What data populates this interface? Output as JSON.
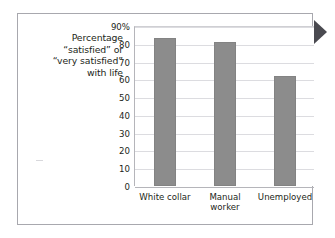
{
  "figure": {
    "axis_title_lines": [
      "Percentage",
      "“satisfied” or",
      "“very satisfied”",
      "with life"
    ],
    "pointer_icon": "right-triangle-pointer-icon",
    "frame_color": "#a8a8ae",
    "bar_color": "#8c8c8c",
    "grid_color": "#dcdce0",
    "text_color": "#231f20"
  },
  "chart_data": {
    "type": "bar",
    "title": "",
    "subtitle": "",
    "xlabel": "",
    "ylabel": "Percentage “satisfied” or “very satisfied” with life",
    "categories": [
      "White collar",
      "Manual worker",
      "Unemployed"
    ],
    "category_lines": [
      [
        "White collar"
      ],
      [
        "Manual",
        "worker"
      ],
      [
        "Unemployed"
      ]
    ],
    "values": [
      83,
      81,
      62
    ],
    "ylim": [
      0,
      90
    ],
    "ytick_values": [
      90,
      80,
      70,
      60,
      50,
      40,
      30,
      20,
      10,
      0
    ],
    "ytick_labels": [
      "90%",
      "80",
      "70",
      "60",
      "50",
      "40",
      "30",
      "20",
      "10",
      "0"
    ],
    "grid": true,
    "grid_axis": "y",
    "legend": false,
    "legend_position": "none"
  }
}
